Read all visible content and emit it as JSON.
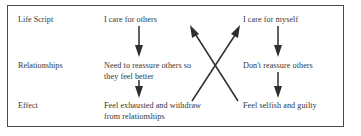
{
  "figure": {
    "border_color": "#4a4a4a",
    "text_color": "#353535",
    "arrow_color": "#2e2e2e",
    "background_color": "#ffffff"
  },
  "rows": [
    {
      "label": "Life Script"
    },
    {
      "label": "Relationships"
    },
    {
      "label": "Effect"
    }
  ],
  "columns": [
    {
      "name": "care-for-others",
      "cells": [
        "I care for others",
        "Need to reassure others so\nthey feel better",
        "Feel exhausted and withdraw\nfrom relationships"
      ]
    },
    {
      "name": "care-for-myself",
      "cells": [
        "I care for myself",
        "Don't reassure others",
        "Feel selfish and guilty"
      ]
    }
  ],
  "arrows": [
    {
      "name": "left-script-to-relationships",
      "direction": "down"
    },
    {
      "name": "left-relationships-to-effect",
      "direction": "down"
    },
    {
      "name": "right-script-to-relationships",
      "direction": "down"
    },
    {
      "name": "right-relationships-to-effect",
      "direction": "down"
    },
    {
      "name": "left-effect-to-right-script",
      "direction": "diagonal-up-right"
    },
    {
      "name": "right-effect-to-left-script",
      "direction": "diagonal-up-left"
    }
  ]
}
